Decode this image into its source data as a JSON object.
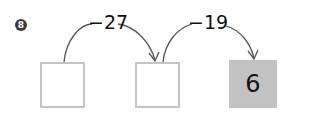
{
  "problem": {
    "number": "8",
    "steps": [
      {
        "operation": "−27"
      },
      {
        "operation": "−19"
      }
    ],
    "boxes": [
      {
        "value": ""
      },
      {
        "value": ""
      },
      {
        "value": "6"
      }
    ]
  },
  "colors": {
    "box_border": "#c4c4c4",
    "filled_box": "#c2c2c2",
    "arrow": "#555555"
  }
}
